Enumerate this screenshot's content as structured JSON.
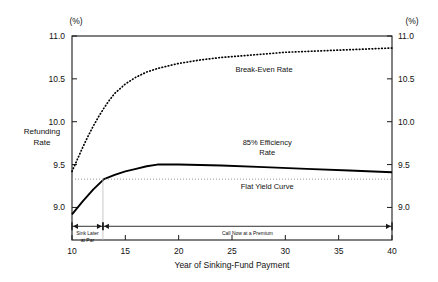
{
  "chart_data": {
    "type": "line",
    "title": "",
    "xlabel": "Year of Sinking-Fund Payment",
    "ylabel": "Refunding Rate",
    "y_unit_left": "(%)",
    "y_unit_right": "(%)",
    "xlim": [
      10,
      40
    ],
    "ylim": [
      8.62,
      11.0
    ],
    "xticks": [
      "10",
      "15",
      "20",
      "25",
      "30",
      "35",
      "40"
    ],
    "xtick_values": [
      10,
      15,
      20,
      25,
      30,
      35,
      40
    ],
    "yticks": [
      "9.0",
      "9.5",
      "10.0",
      "10.5",
      "11.0"
    ],
    "ytick_values": [
      9.0,
      9.5,
      10.0,
      10.5,
      11.0
    ],
    "grid": false,
    "legend_position": "inline-annotations",
    "series": [
      {
        "name": "Break-Even Rate",
        "style": "dotted",
        "label": "Break-Even Rate",
        "label_x": 28.0,
        "label_y": 10.58,
        "x": [
          10,
          10.5,
          11,
          11.5,
          12,
          12.5,
          13,
          13.5,
          14,
          15,
          16,
          17,
          18,
          19,
          20,
          22,
          24,
          26,
          28,
          30,
          32,
          34,
          36,
          38,
          40
        ],
        "y": [
          9.42,
          9.56,
          9.7,
          9.83,
          9.95,
          10.06,
          10.16,
          10.25,
          10.33,
          10.44,
          10.52,
          10.58,
          10.62,
          10.65,
          10.68,
          10.72,
          10.75,
          10.77,
          10.79,
          10.81,
          10.82,
          10.83,
          10.84,
          10.85,
          10.86
        ]
      },
      {
        "name": "85% Efficiency Rate",
        "style": "solid",
        "label": "85% Efficiency\nRate",
        "label_line1": "85% Efficiency",
        "label_line2": "Rate",
        "label_x": 28.3,
        "label_y": 9.73,
        "x": [
          10,
          11,
          12,
          13,
          14,
          15,
          16,
          17,
          18,
          20,
          24,
          28,
          32,
          36,
          40
        ],
        "y": [
          8.92,
          9.07,
          9.21,
          9.33,
          9.38,
          9.42,
          9.45,
          9.48,
          9.5,
          9.5,
          9.49,
          9.47,
          9.45,
          9.43,
          9.41
        ]
      },
      {
        "name": "Flat Yield Curve",
        "style": "dotted-horizontal",
        "label": "Flat Yield Curve",
        "label_x": 28.3,
        "label_y": 9.22,
        "value": 9.33,
        "x": [
          10,
          40
        ],
        "y": [
          9.33,
          9.33
        ]
      }
    ],
    "annotations": [
      {
        "name": "sink-later-at-par",
        "line1": "Sink Later",
        "line2": "at Par",
        "span_start": 10,
        "span_end": 12.9,
        "bracket_y": 8.78
      },
      {
        "name": "call-now-at-a-premium",
        "text": "Call Now at a Premium",
        "span_start": 12.9,
        "span_end": 40,
        "bracket_y": 8.78
      }
    ]
  },
  "colors": {
    "axis": "#1a1a1a",
    "series_solid": "#000000",
    "series_dotted": "#000000",
    "flat_yield": "#999999",
    "background": "#ffffff"
  }
}
